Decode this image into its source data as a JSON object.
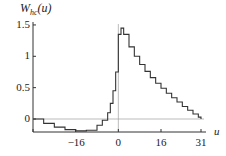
{
  "chart_data": {
    "type": "line",
    "title": "",
    "ylabel": "W_hc(u)",
    "ylabel_main": "W",
    "ylabel_sub": "hc",
    "ylabel_arg": "(u)",
    "xlabel": "u",
    "xlim": [
      -32,
      31
    ],
    "ylim": [
      -0.25,
      1.5
    ],
    "x_ticks": [
      -16,
      0,
      16,
      31
    ],
    "x_tick_labels": [
      "−16",
      "0",
      "16",
      "31"
    ],
    "y_ticks": [
      0,
      0.5,
      1,
      1.5
    ],
    "y_tick_labels": [
      "0",
      "0.5",
      "1",
      "1.5"
    ],
    "reference_lines": {
      "horizontal": 0,
      "vertical": 0
    },
    "grid": false,
    "series": [
      {
        "name": "W_hc(u)",
        "style": "step",
        "x": [
          -32,
          -28,
          -24,
          -20,
          -16,
          -12,
          -8,
          -6,
          -4,
          -3,
          -2,
          -1,
          0,
          1,
          2,
          4,
          6,
          8,
          10,
          12,
          14,
          16,
          18,
          20,
          22,
          24,
          26,
          28,
          30,
          31
        ],
        "y": [
          0,
          -0.07,
          -0.13,
          -0.17,
          -0.19,
          -0.18,
          -0.1,
          -0.02,
          0.1,
          0.25,
          0.45,
          0.75,
          1.35,
          1.45,
          1.35,
          1.15,
          1.0,
          0.87,
          0.76,
          0.66,
          0.57,
          0.49,
          0.41,
          0.34,
          0.27,
          0.2,
          0.14,
          0.08,
          0.03,
          0.0
        ]
      }
    ]
  }
}
